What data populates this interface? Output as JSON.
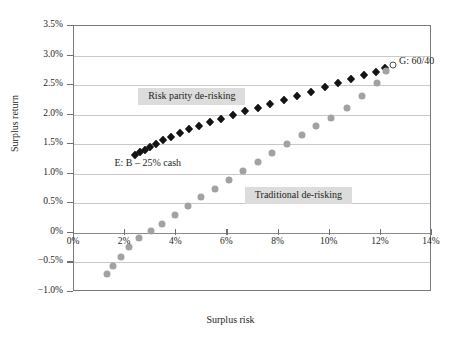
{
  "chart_data": {
    "type": "scatter",
    "title": "",
    "xlabel": "Surplus risk",
    "ylabel": "Surplus return",
    "xlim": [
      0,
      14
    ],
    "ylim": [
      -1.0,
      3.5
    ],
    "xticks": [
      "0%",
      "2%",
      "4%",
      "6%",
      "8%",
      "10%",
      "12%",
      "14%"
    ],
    "xtick_values": [
      0,
      2,
      4,
      6,
      8,
      10,
      12,
      14
    ],
    "yticks": [
      "3.5%",
      "3.0%",
      "2.5%",
      "2.0%",
      "1.5%",
      "1.0%",
      "0.5%",
      "0%",
      "-0.5%",
      "-1.0%"
    ],
    "ytick_values": [
      3.5,
      3.0,
      2.5,
      2.0,
      1.5,
      1.0,
      0.5,
      0.0,
      -0.5,
      -1.0
    ],
    "grid": true,
    "legend_position": "inline-annotations",
    "series": [
      {
        "name": "Risk parity de-risking",
        "marker": "black-diamond",
        "color": "#141414",
        "points": [
          [
            2.4,
            1.31
          ],
          [
            2.58,
            1.36
          ],
          [
            2.76,
            1.41
          ],
          [
            2.96,
            1.46
          ],
          [
            3.2,
            1.51
          ],
          [
            3.48,
            1.57
          ],
          [
            3.8,
            1.63
          ],
          [
            4.14,
            1.69
          ],
          [
            4.5,
            1.75
          ],
          [
            4.9,
            1.81
          ],
          [
            5.32,
            1.87
          ],
          [
            5.76,
            1.93
          ],
          [
            6.22,
            1.99
          ],
          [
            6.7,
            2.06
          ],
          [
            7.18,
            2.12
          ],
          [
            7.68,
            2.18
          ],
          [
            8.2,
            2.25
          ],
          [
            8.72,
            2.32
          ],
          [
            9.26,
            2.39
          ],
          [
            9.8,
            2.46
          ],
          [
            10.32,
            2.53
          ],
          [
            10.84,
            2.6
          ],
          [
            11.34,
            2.67
          ],
          [
            11.8,
            2.73
          ],
          [
            12.18,
            2.79
          ]
        ]
      },
      {
        "name": "Traditional de-risking",
        "marker": "gray-circle",
        "color": "#a2a2a2",
        "points": [
          [
            1.3,
            -0.7
          ],
          [
            1.52,
            -0.56
          ],
          [
            1.82,
            -0.4
          ],
          [
            2.16,
            -0.24
          ],
          [
            2.56,
            -0.09
          ],
          [
            3.0,
            0.03
          ],
          [
            3.46,
            0.15
          ],
          [
            3.96,
            0.3
          ],
          [
            4.46,
            0.45
          ],
          [
            4.98,
            0.6
          ],
          [
            5.52,
            0.75
          ],
          [
            6.06,
            0.9
          ],
          [
            6.62,
            1.05
          ],
          [
            7.18,
            1.2
          ],
          [
            7.74,
            1.35
          ],
          [
            8.32,
            1.5
          ],
          [
            8.9,
            1.65
          ],
          [
            9.48,
            1.8
          ],
          [
            10.06,
            1.95
          ],
          [
            10.66,
            2.12
          ],
          [
            11.26,
            2.32
          ],
          [
            11.84,
            2.54
          ],
          [
            12.22,
            2.74
          ]
        ]
      },
      {
        "name": "G: 60/40",
        "marker": "hollow-circle",
        "color": "#4a4a4a",
        "points": [
          [
            12.48,
            2.84
          ]
        ]
      }
    ],
    "annotations": [
      {
        "id": "risk-parity-callout",
        "text": "Risk parity de-risking",
        "style": "shaded-box",
        "x": 2.55,
        "y": 2.3
      },
      {
        "id": "traditional-callout",
        "text": "Traditional de-risking",
        "style": "shaded-box",
        "x": 6.72,
        "y": 0.62
      },
      {
        "id": "point-e-label",
        "text": "E: B – 25% cash",
        "style": "plain",
        "x": 1.62,
        "y": 1.14
      },
      {
        "id": "point-g-label",
        "text": "G: 60/40",
        "style": "plain",
        "x": 12.75,
        "y": 2.86
      }
    ]
  }
}
